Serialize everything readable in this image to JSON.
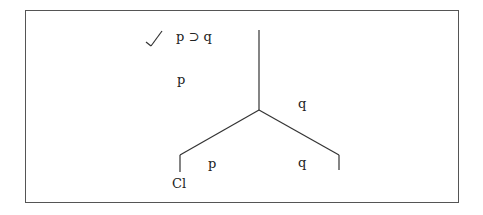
{
  "diagram": {
    "type": "truth-tree",
    "premise": {
      "check": "✓",
      "formula": "p ⊃ q"
    },
    "stacked": [
      "p",
      "q"
    ],
    "branches": {
      "left": "p",
      "right": "q"
    },
    "closure_mark": "Cl"
  }
}
